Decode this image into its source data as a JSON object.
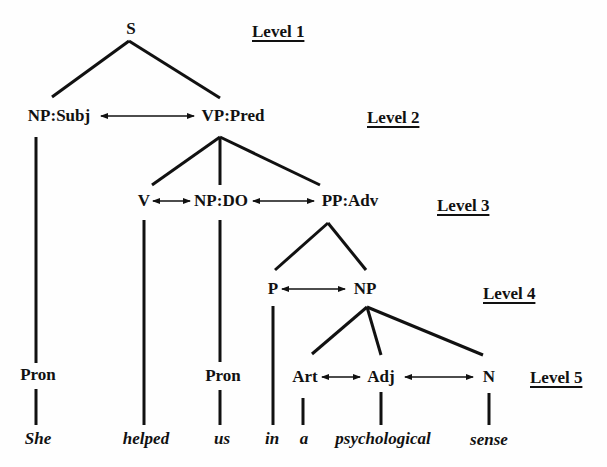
{
  "diagram": {
    "type": "syntax-tree",
    "levels": [
      "Level 1",
      "Level 2",
      "Level 3",
      "Level 4",
      "Level 5"
    ],
    "nodes": {
      "s": "S",
      "np_subj": "NP:Subj",
      "vp_pred": "VP:Pred",
      "v": "V",
      "np_do": "NP:DO",
      "pp_adv": "PP:Adv",
      "p": "P",
      "np": "NP",
      "pron1": "Pron",
      "pron2": "Pron",
      "art": "Art",
      "adj": "Adj",
      "n": "N"
    },
    "words": [
      "She",
      "helped",
      "us",
      "in",
      "a",
      "psychological",
      "sense"
    ],
    "edges": [
      [
        "S",
        "NP:Subj"
      ],
      [
        "S",
        "VP:Pred"
      ],
      [
        "NP:Subj",
        "Pron"
      ],
      [
        "Pron",
        "She"
      ],
      [
        "VP:Pred",
        "V"
      ],
      [
        "VP:Pred",
        "NP:DO"
      ],
      [
        "VP:Pred",
        "PP:Adv"
      ],
      [
        "V",
        "helped"
      ],
      [
        "NP:DO",
        "Pron"
      ],
      [
        "Pron",
        "us"
      ],
      [
        "PP:Adv",
        "P"
      ],
      [
        "PP:Adv",
        "NP"
      ],
      [
        "P",
        "in"
      ],
      [
        "NP",
        "Art"
      ],
      [
        "NP",
        "Adj"
      ],
      [
        "NP",
        "N"
      ],
      [
        "Art",
        "a"
      ],
      [
        "Adj",
        "psychological"
      ],
      [
        "N",
        "sense"
      ]
    ],
    "bidirectional_arrows": [
      [
        "NP:Subj",
        "VP:Pred"
      ],
      [
        "V",
        "NP:DO"
      ],
      [
        "NP:DO",
        "PP:Adv"
      ],
      [
        "P",
        "NP"
      ],
      [
        "Art",
        "Adj"
      ],
      [
        "Adj",
        "N"
      ]
    ]
  }
}
